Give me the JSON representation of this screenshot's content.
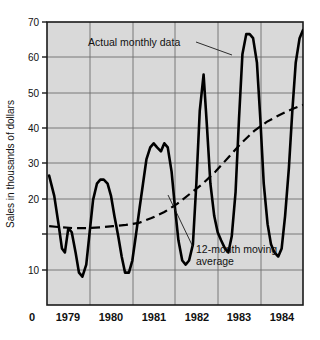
{
  "chart_data": {
    "type": "line",
    "title": "",
    "xlabel": "",
    "ylabel": "Sales in thousands of dollars",
    "ylim": [
      0,
      70
    ],
    "yticks": [
      10,
      20,
      30,
      40,
      50,
      60,
      70
    ],
    "xlim": [
      1978.75,
      1984.75
    ],
    "xticks": [
      "1979",
      "1980",
      "1981",
      "1982",
      "1983",
      "1984"
    ],
    "x_origin_label": "0",
    "grid": true,
    "legend": "none",
    "plot_background": "#d9d9d9",
    "line_color": "#000000",
    "annotations": [
      {
        "name": "actual-monthly-data",
        "text": "Actual monthly data",
        "points_to_series": "Actual monthly data"
      },
      {
        "name": "twelve-month-moving-average",
        "text": "12-month moving average",
        "text_line_1": "12-month moving",
        "text_line_2": "average",
        "points_to_series": "12-month moving average"
      }
    ],
    "series": [
      {
        "name": "Actual monthly data",
        "style": "solid",
        "x": [
          1978.8,
          1978.92,
          1979.02,
          1979.1,
          1979.17,
          1979.25,
          1979.33,
          1979.42,
          1979.5,
          1979.58,
          1979.67,
          1979.75,
          1979.83,
          1979.92,
          1980.0,
          1980.08,
          1980.17,
          1980.25,
          1980.33,
          1980.42,
          1980.5,
          1980.58,
          1980.67,
          1980.75,
          1980.83,
          1980.92,
          1981.0,
          1981.08,
          1981.17,
          1981.25,
          1981.33,
          1981.42,
          1981.5,
          1981.58,
          1981.67,
          1981.75,
          1981.83,
          1981.92,
          1982.0,
          1982.08,
          1982.17,
          1982.25,
          1982.33,
          1982.42,
          1982.5,
          1982.58,
          1982.67,
          1982.75,
          1982.83,
          1982.92,
          1983.0,
          1983.08,
          1983.17,
          1983.25,
          1983.33,
          1983.42,
          1983.5,
          1983.58,
          1983.67,
          1983.75,
          1983.83,
          1983.92,
          1984.0,
          1984.08,
          1984.17,
          1984.25,
          1984.33,
          1984.42,
          1984.5,
          1984.58,
          1984.67,
          1984.75
        ],
        "values": [
          32,
          27,
          20,
          14,
          13,
          19,
          18,
          13,
          8,
          7,
          10,
          18,
          26,
          30,
          31,
          31,
          30,
          27,
          22,
          17,
          12,
          8,
          8,
          11,
          17,
          24,
          30,
          36,
          39,
          40,
          39,
          38,
          40,
          39,
          33,
          24,
          16,
          11,
          10,
          11,
          15,
          30,
          48,
          57,
          44,
          30,
          22,
          18,
          16,
          14,
          13,
          17,
          28,
          46,
          62,
          67,
          67,
          66,
          60,
          46,
          30,
          20,
          15,
          13,
          12,
          14,
          22,
          34,
          48,
          60,
          66,
          68
        ]
      },
      {
        "name": "12-month moving average",
        "style": "dashed",
        "x": [
          1978.8,
          1979.1,
          1979.4,
          1979.7,
          1980.0,
          1980.3,
          1980.6,
          1980.9,
          1981.2,
          1981.5,
          1981.8,
          1982.1,
          1982.4,
          1982.7,
          1983.0,
          1983.3,
          1983.6,
          1983.9,
          1984.2,
          1984.5,
          1984.75
        ],
        "values": [
          19.5,
          19.2,
          19.0,
          19.0,
          19.2,
          19.5,
          19.8,
          20.3,
          21.5,
          23.0,
          25.0,
          27.5,
          30.0,
          33.0,
          36.5,
          40.0,
          43.0,
          45.3,
          47.0,
          48.5,
          49.5
        ]
      }
    ]
  }
}
